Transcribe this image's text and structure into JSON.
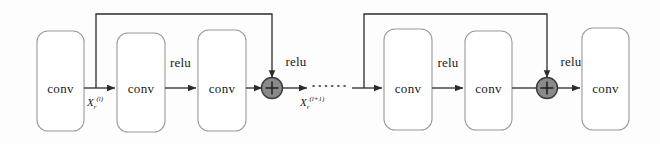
{
  "figure": {
    "kind": "residual-block-chain-diagram",
    "background_color": "#fdfdfd",
    "stroke_color": "#2b2b2b",
    "box_stroke_color": "#9a9a9a",
    "sum_fill_color": "#8a8a8a",
    "sum_stroke_color": "#3a3a3a"
  },
  "blocks": [
    {
      "id": "conv-0",
      "label": "conv"
    },
    {
      "id": "conv-1",
      "label": "conv"
    },
    {
      "id": "conv-2",
      "label": "conv"
    },
    {
      "id": "conv-3",
      "label": "conv"
    },
    {
      "id": "conv-4",
      "label": "conv"
    },
    {
      "id": "conv-5",
      "label": "conv"
    }
  ],
  "activations": [
    {
      "id": "relu-1",
      "label": "relu"
    },
    {
      "id": "relu-2",
      "label": "relu"
    },
    {
      "id": "relu-3",
      "label": "relu"
    },
    {
      "id": "relu-4",
      "label": "relu"
    }
  ],
  "sum_nodes": [
    {
      "id": "sum-1",
      "glyph": "+"
    },
    {
      "id": "sum-2",
      "glyph": "+"
    }
  ],
  "tensors": [
    {
      "id": "tensor-in",
      "base": "X",
      "subscript": "r",
      "superscript": "(l)"
    },
    {
      "id": "tensor-out",
      "base": "X",
      "subscript": "r",
      "superscript": "(l+1)"
    }
  ],
  "continuation": {
    "id": "ellipsis",
    "style": "dotted-line"
  }
}
